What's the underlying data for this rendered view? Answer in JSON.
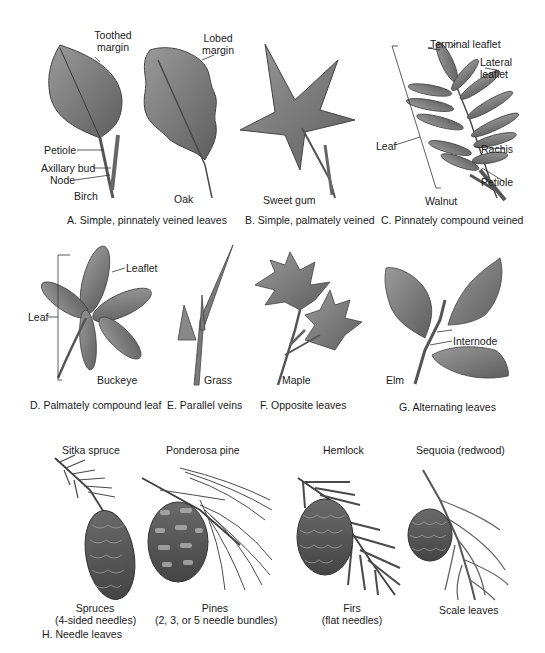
{
  "panels": {
    "A": {
      "caption": "A. Simple, pinnately veined leaves",
      "birch": {
        "name": "Birch",
        "labels": {
          "toothed_margin_1": "Toothed",
          "toothed_margin_2": "margin",
          "petiole": "Petiole",
          "axillary_bud": "Axillary bud",
          "node": "Node"
        }
      },
      "oak": {
        "name": "Oak",
        "labels": {
          "lobed_margin_1": "Lobed",
          "lobed_margin_2": "margin"
        }
      }
    },
    "B": {
      "caption": "B. Simple, palmately veined",
      "name": "Sweet gum"
    },
    "C": {
      "caption": "C. Pinnately compound veined",
      "name": "Walnut",
      "labels": {
        "terminal_leaflet": "Terminal leaflet",
        "lateral_leaflet_1": "Lateral",
        "lateral_leaflet_2": "leaflet",
        "leaf": "Leaf",
        "rachis": "Rachis",
        "petiole": "Petiole"
      }
    },
    "D": {
      "caption": "D. Palmately compound leaf",
      "name": "Buckeye",
      "labels": {
        "leaflet": "Leaflet",
        "leaf": "Leaf"
      }
    },
    "E": {
      "caption": "E. Parallel veins",
      "name": "Grass"
    },
    "F": {
      "caption": "F. Opposite leaves",
      "name": "Maple"
    },
    "G": {
      "caption": "G. Alternating leaves",
      "name": "Elm",
      "labels": {
        "internode": "Internode"
      }
    },
    "H": {
      "caption": "H. Needle leaves",
      "items": [
        {
          "species": "Sitka spruce",
          "group": "Spruces",
          "detail": "(4-sided needles)"
        },
        {
          "species": "Ponderosa pine",
          "group": "Pines",
          "detail": "(2, 3, or 5 needle bundles)"
        },
        {
          "species": "Hemlock",
          "group": "Firs",
          "detail": "(flat needles)"
        },
        {
          "species": "Sequoia (redwood)",
          "group": "Scale leaves",
          "detail": ""
        }
      ]
    }
  },
  "colors": {
    "leaf_fill": "#7d7d7d",
    "leaf_dark": "#555555",
    "stroke": "#333333",
    "background": "#ffffff"
  }
}
